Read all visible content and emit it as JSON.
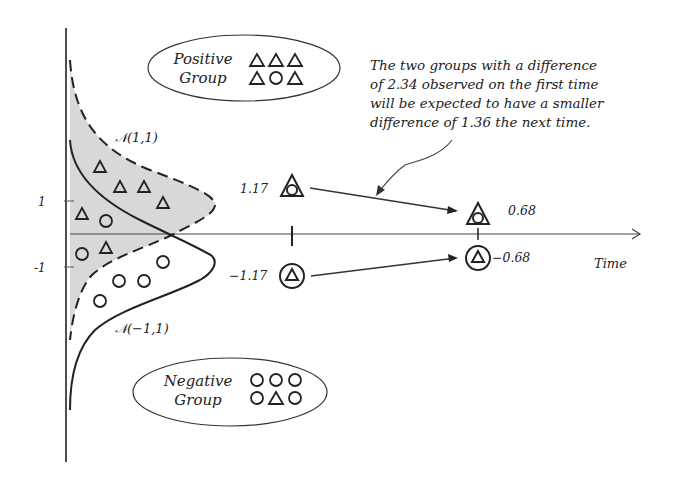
{
  "diagram": {
    "annotation": {
      "lines": [
        "The two groups with a difference",
        "of 2.34 observed on the first time",
        "will be expected to have a smaller",
        "difference of 1.36 the next time."
      ]
    },
    "positive_group": {
      "label_line1": "Positive",
      "label_line2": "Group",
      "symbols_row1": [
        "triangle",
        "triangle",
        "triangle"
      ],
      "symbols_row2": [
        "triangle",
        "circle",
        "triangle"
      ]
    },
    "negative_group": {
      "label_line1": "Negative",
      "label_line2": "Group",
      "symbols_row1": [
        "circle",
        "circle",
        "circle"
      ],
      "symbols_row2": [
        "circle",
        "triangle",
        "circle"
      ]
    },
    "distributions": {
      "positive_label": "𝒩(1,1)",
      "negative_label": "𝒩(−1,1)"
    },
    "y_axis": {
      "tick_pos": "1",
      "tick_neg": "-1"
    },
    "x_axis": {
      "label": "Time"
    },
    "first_time": {
      "positive_value": "1.17",
      "negative_value": "−1.17"
    },
    "next_time": {
      "positive_value": "0.68",
      "negative_value": "−0.68"
    },
    "colors": {
      "line": "#222222",
      "shade": "#d6d6d6"
    }
  }
}
